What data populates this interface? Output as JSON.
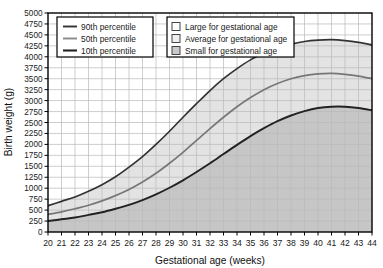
{
  "chart_data": {
    "type": "line",
    "title": "",
    "xlabel": "Gestational age (weeks)",
    "ylabel": "Birth weight (g)",
    "xlim": [
      20,
      44
    ],
    "ylim": [
      0,
      5000
    ],
    "grid": true,
    "xticks": [
      20,
      21,
      22,
      23,
      24,
      25,
      26,
      27,
      28,
      29,
      30,
      31,
      32,
      33,
      34,
      35,
      36,
      37,
      38,
      39,
      40,
      41,
      42,
      43,
      44
    ],
    "yticks": [
      0,
      250,
      500,
      750,
      1000,
      1250,
      1500,
      1750,
      2000,
      2250,
      2500,
      2750,
      3000,
      3250,
      3500,
      3750,
      4000,
      4250,
      4500,
      4750,
      5000
    ],
    "x": [
      20,
      21,
      22,
      23,
      24,
      25,
      26,
      27,
      28,
      29,
      30,
      31,
      32,
      33,
      34,
      35,
      36,
      37,
      38,
      39,
      40,
      41,
      42,
      43,
      44
    ],
    "series": [
      {
        "name": "90th percentile",
        "color": "#333333",
        "values": [
          600,
          700,
          800,
          930,
          1080,
          1260,
          1480,
          1720,
          2000,
          2300,
          2620,
          2930,
          3230,
          3500,
          3730,
          3930,
          4080,
          4200,
          4290,
          4350,
          4380,
          4390,
          4370,
          4330,
          4270
        ]
      },
      {
        "name": "50th percentile",
        "color": "#777777",
        "values": [
          400,
          460,
          530,
          610,
          710,
          830,
          970,
          1140,
          1340,
          1570,
          1820,
          2090,
          2360,
          2620,
          2860,
          3070,
          3250,
          3390,
          3500,
          3570,
          3610,
          3620,
          3600,
          3560,
          3500
        ]
      },
      {
        "name": "10th percentile",
        "color": "#222222",
        "values": [
          250,
          290,
          330,
          390,
          450,
          530,
          620,
          730,
          860,
          1010,
          1180,
          1370,
          1570,
          1780,
          1990,
          2190,
          2370,
          2530,
          2660,
          2760,
          2830,
          2860,
          2860,
          2830,
          2780
        ]
      }
    ],
    "regions": [
      {
        "name": "Large for gestational age",
        "swatch": "white",
        "color": "#ffffff"
      },
      {
        "name": "Average for gestational age",
        "swatch": "light-gray",
        "color": "#e3e3e3"
      },
      {
        "name": "Small for gestational age",
        "swatch": "mid-gray",
        "color": "#c6c6c6"
      }
    ]
  },
  "legends": {
    "percentile_legend": {
      "items": [
        {
          "label": "90th percentile"
        },
        {
          "label": "50th percentile"
        },
        {
          "label": "10th percentile"
        }
      ]
    },
    "region_legend": {
      "items": [
        {
          "label": "Large for gestational age"
        },
        {
          "label": "Average for gestational age"
        },
        {
          "label": "Small for gestational age"
        }
      ]
    }
  },
  "axes": {
    "y_title": "Birth weight (g)",
    "x_title": "Gestational age (weeks)",
    "y_labels": [
      "5000",
      "4750",
      "4500",
      "4250",
      "4000",
      "3750",
      "3500",
      "3250",
      "3000",
      "2750",
      "2500",
      "2250",
      "2000",
      "1750",
      "1500",
      "1250",
      "1000",
      "750",
      "500",
      "250",
      "0"
    ],
    "x_labels": [
      "20",
      "21",
      "22",
      "23",
      "24",
      "25",
      "26",
      "27",
      "28",
      "29",
      "30",
      "31",
      "32",
      "33",
      "34",
      "35",
      "36",
      "37",
      "38",
      "39",
      "40",
      "41",
      "42",
      "43",
      "44"
    ]
  },
  "colors": {
    "axis": "#000000",
    "grid": "#b9b9b9",
    "region_large": "#ffffff",
    "region_average": "#e3e3e3",
    "region_small": "#c6c6c6",
    "line_90": "#333333",
    "line_50": "#777777",
    "line_10": "#222222"
  }
}
